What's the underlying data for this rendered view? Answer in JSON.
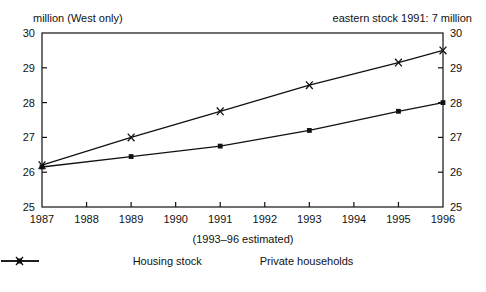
{
  "chart_data": {
    "type": "line",
    "title": "",
    "unit_label": "million (West only)",
    "annotation": "eastern stock 1991: 7 million",
    "subtitle": "(1993–96 estimated)",
    "xlabel": "",
    "ylabel": "",
    "x": [
      1987,
      1988,
      1989,
      1990,
      1991,
      1992,
      1993,
      1994,
      1995,
      1996
    ],
    "xtick_labels": [
      "1987",
      "1988",
      "1989",
      "1990",
      "1991",
      "1992",
      "1993",
      "1994",
      "1995",
      "1996"
    ],
    "xlim": [
      1987,
      1996
    ],
    "ylim": [
      25,
      30
    ],
    "ytick_labels": [
      "25",
      "26",
      "27",
      "28",
      "29",
      "30"
    ],
    "yticks": [
      25,
      26,
      27,
      28,
      29,
      30
    ],
    "grid": false,
    "dual_y_axis": true,
    "legend_position": "bottom",
    "series": [
      {
        "name": "Housing stock",
        "marker": "square",
        "color": "#111111",
        "points": [
          {
            "x": 1987,
            "y": 26.15
          },
          {
            "x": 1989,
            "y": 26.45
          },
          {
            "x": 1991,
            "y": 26.75
          },
          {
            "x": 1993,
            "y": 27.2
          },
          {
            "x": 1995,
            "y": 27.75
          },
          {
            "x": 1996,
            "y": 28.0
          }
        ]
      },
      {
        "name": "Private households",
        "marker": "cross",
        "color": "#111111",
        "points": [
          {
            "x": 1987,
            "y": 26.2
          },
          {
            "x": 1989,
            "y": 27.0
          },
          {
            "x": 1991,
            "y": 27.75
          },
          {
            "x": 1993,
            "y": 28.5
          },
          {
            "x": 1995,
            "y": 29.15
          },
          {
            "x": 1996,
            "y": 29.5
          }
        ]
      }
    ]
  },
  "legend": {
    "items": [
      {
        "label": "Housing stock",
        "marker": "square"
      },
      {
        "label": "Private households",
        "marker": "cross"
      }
    ]
  }
}
